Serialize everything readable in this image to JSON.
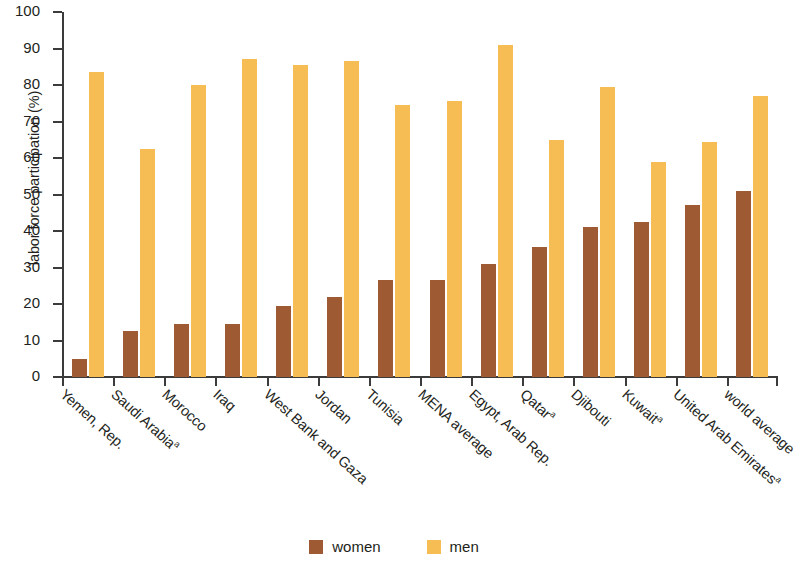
{
  "chart_data": {
    "type": "bar",
    "title": "",
    "xlabel": "",
    "ylabel": "labor force participation (%)",
    "ylim": [
      0,
      100
    ],
    "ytick_step": 10,
    "yticks": [
      0,
      10,
      20,
      30,
      40,
      50,
      60,
      70,
      80,
      90,
      100
    ],
    "grid": false,
    "legend_position": "bottom-center",
    "categories": [
      "Yemen, Rep.",
      "Saudi Arabiaᵃ",
      "Morocco",
      "Iraq",
      "West Bank and Gaza",
      "Jordan",
      "Tunisia",
      "MENA average",
      "Egypt, Arab Rep.",
      "Qatarᵃ",
      "Djibouti",
      "Kuwaitᵃ",
      "United Arab Emiratesᵃ",
      "world average"
    ],
    "category_labels": [
      {
        "text": "Yemen, Rep.",
        "superscript": ""
      },
      {
        "text": "Saudi Arabia",
        "superscript": "a"
      },
      {
        "text": "Morocco",
        "superscript": ""
      },
      {
        "text": "Iraq",
        "superscript": ""
      },
      {
        "text": "West Bank and Gaza",
        "superscript": ""
      },
      {
        "text": "Jordan",
        "superscript": ""
      },
      {
        "text": "Tunisia",
        "superscript": ""
      },
      {
        "text": "MENA average",
        "superscript": ""
      },
      {
        "text": "Egypt, Arab Rep.",
        "superscript": ""
      },
      {
        "text": "Qatar",
        "superscript": "a"
      },
      {
        "text": "Djibouti",
        "superscript": ""
      },
      {
        "text": "Kuwait",
        "superscript": "a"
      },
      {
        "text": "United Arab Emirates",
        "superscript": "a"
      },
      {
        "text": "world average",
        "superscript": ""
      }
    ],
    "series": [
      {
        "name": "women",
        "color": "#9e5a33",
        "values": [
          5,
          12.5,
          14.5,
          14.5,
          19.5,
          22,
          26.5,
          26.5,
          31,
          35.5,
          41,
          42.5,
          47,
          51
        ]
      },
      {
        "name": "men",
        "color": "#f5bd54",
        "values": [
          83.5,
          62.5,
          80,
          87,
          85.5,
          86.5,
          74.5,
          75.5,
          91,
          65,
          79.5,
          59,
          64.5,
          77
        ]
      }
    ]
  },
  "legend": {
    "items": [
      {
        "label": "women",
        "color": "#9e5a33"
      },
      {
        "label": "men",
        "color": "#f5bd54"
      }
    ]
  },
  "axis": {
    "y_title": "labor force participation (%)"
  }
}
